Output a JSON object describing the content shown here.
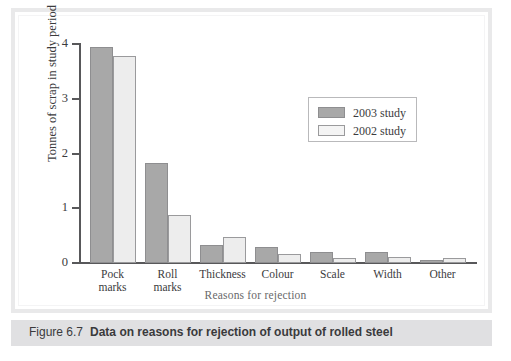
{
  "figure": {
    "caption_number": "Figure 6.7",
    "caption_title": "Data on reasons for rejection of output of rolled steel"
  },
  "legend": {
    "position": "inside-top-right",
    "entries": [
      {
        "label": "2003 study",
        "color": "#a8a8a8"
      },
      {
        "label": "2002 study",
        "color": "#ededed"
      }
    ]
  },
  "axes": {
    "y_title": "Tonnes of scrap in study period",
    "x_title": "Reasons for rejection",
    "y_ticks": [
      "0",
      "1",
      "2",
      "3",
      "4"
    ]
  },
  "chart_data": {
    "type": "bar",
    "title": "Data on reasons for rejection of output of rolled steel",
    "xlabel": "Reasons for rejection",
    "ylabel": "Tonnes of scrap in study period",
    "ylim": [
      0,
      4
    ],
    "yticks": [
      0,
      1,
      2,
      3,
      4
    ],
    "grid": false,
    "legend_position": "upper right",
    "categories": [
      "Pock marks",
      "Roll marks",
      "Thickness",
      "Colour",
      "Scale",
      "Width",
      "Other"
    ],
    "category_lines": [
      [
        "Pock",
        "marks"
      ],
      [
        "Roll",
        "marks"
      ],
      [
        "Thickness"
      ],
      [
        "Colour"
      ],
      [
        "Scale"
      ],
      [
        "Width"
      ],
      [
        "Other"
      ]
    ],
    "series": [
      {
        "name": "2003 study",
        "color": "#a8a8a8",
        "values": [
          3.95,
          1.82,
          0.33,
          0.3,
          0.2,
          0.21,
          0.05
        ]
      },
      {
        "name": "2002 study",
        "color": "#ededed",
        "values": [
          3.78,
          0.87,
          0.47,
          0.17,
          0.1,
          0.11,
          0.1
        ]
      }
    ]
  }
}
